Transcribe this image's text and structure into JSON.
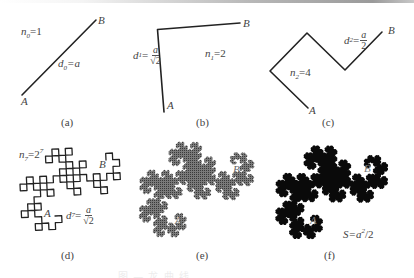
{
  "figure": {
    "panels": [
      {
        "id": "a",
        "caption": "(a)",
        "order": 0,
        "A": [
          22,
          95
        ],
        "B": [
          96,
          20
        ],
        "labels": {
          "A": "A",
          "B": "B",
          "n": "n",
          "n_sub": "0",
          "n_val": "=1",
          "d": "d",
          "d_sub": "0",
          "d_val": "=a"
        }
      },
      {
        "id": "b",
        "caption": "(b)",
        "order": 1,
        "A": [
          164,
          112
        ],
        "B": [
          240,
          23
        ],
        "labels": {
          "A": "A",
          "B": "B",
          "n": "n",
          "n_sub": "1",
          "n_val": "=2",
          "d": "d",
          "d_sub": "1",
          "d_eq": "=",
          "d_num": "a",
          "d_den": "√2"
        }
      },
      {
        "id": "c",
        "caption": "(c)",
        "order": 2,
        "A": [
          308,
          108
        ],
        "B": [
          382,
          32
        ],
        "labels": {
          "A": "A",
          "B": "B",
          "n": "n",
          "n_sub": "2",
          "n_val": "=4",
          "d": "d",
          "d_sub": "2",
          "d_eq": "=",
          "d_num": "a",
          "d_den": "2"
        }
      },
      {
        "id": "d",
        "caption": "(d)",
        "order": 7,
        "A": [
          55,
          216
        ],
        "B": [
          106,
          160
        ],
        "labels": {
          "A": "A",
          "B": "B",
          "n": "n",
          "n_sub": "7",
          "n_val": "=2",
          "n_sup": "7",
          "d": "d",
          "d_sub": "7",
          "d_eq": "=",
          "d_num": "a",
          "d_den": "√2"
        }
      },
      {
        "id": "e",
        "caption": "(e)",
        "order": 12,
        "A": [
          177,
          218
        ],
        "B": [
          235,
          162
        ],
        "labels": {
          "A": "A",
          "B": "B"
        }
      },
      {
        "id": "f",
        "caption": "(f)",
        "order": 14,
        "A": [
          313,
          220
        ],
        "B": [
          369,
          165
        ],
        "labels": {
          "A": "A",
          "B": "B",
          "S": "S=a",
          "S_sup": "2",
          "S_tail": "/2"
        }
      }
    ],
    "colors": {
      "stroke": "#222222",
      "hatch": "#555555",
      "fill": "#0a0a0a",
      "text": "#444444"
    },
    "bottom_caption": "图 — 龙 曲 线"
  }
}
